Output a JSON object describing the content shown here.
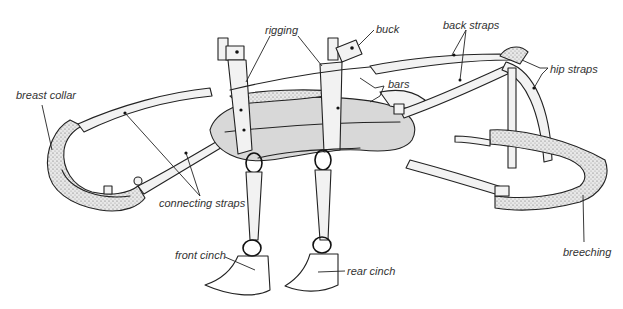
{
  "diagram": {
    "style": "black-and-white line illustration",
    "labels": [
      {
        "id": "rigging",
        "text": "rigging",
        "x": 265,
        "y": 24
      },
      {
        "id": "buck",
        "text": "buck",
        "x": 376,
        "y": 23
      },
      {
        "id": "back_straps",
        "text": "back straps",
        "x": 443,
        "y": 19
      },
      {
        "id": "bars",
        "text": "bars",
        "x": 388,
        "y": 78
      },
      {
        "id": "hip_straps",
        "text": "hip straps",
        "x": 550,
        "y": 63
      },
      {
        "id": "breast_collar",
        "text": "breast collar",
        "x": 16,
        "y": 89
      },
      {
        "id": "connecting_straps",
        "text": "connecting straps",
        "x": 159,
        "y": 197
      },
      {
        "id": "front_cinch",
        "text": "front cinch",
        "x": 175,
        "y": 249
      },
      {
        "id": "rear_cinch",
        "text": "rear cinch",
        "x": 347,
        "y": 265
      },
      {
        "id": "breeching",
        "text": "breeching",
        "x": 563,
        "y": 246
      }
    ]
  }
}
